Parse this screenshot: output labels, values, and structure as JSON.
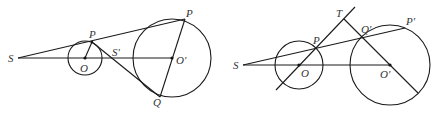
{
  "figures": [
    {
      "name": "left-figure",
      "labels": {
        "S": "S",
        "P_small": "P",
        "O": "O",
        "S_prime": "S'",
        "P_big": "P",
        "O_prime": "O'",
        "Q": "Q"
      }
    },
    {
      "name": "right-figure",
      "labels": {
        "S": "S",
        "T": "T",
        "P": "P",
        "O": "O",
        "Q_prime": "Q'",
        "P_prime": "P'",
        "O_prime": "O'"
      }
    }
  ],
  "colors": {
    "stroke": "#1a1a1a",
    "label": "#333333",
    "background": "#ffffff"
  }
}
